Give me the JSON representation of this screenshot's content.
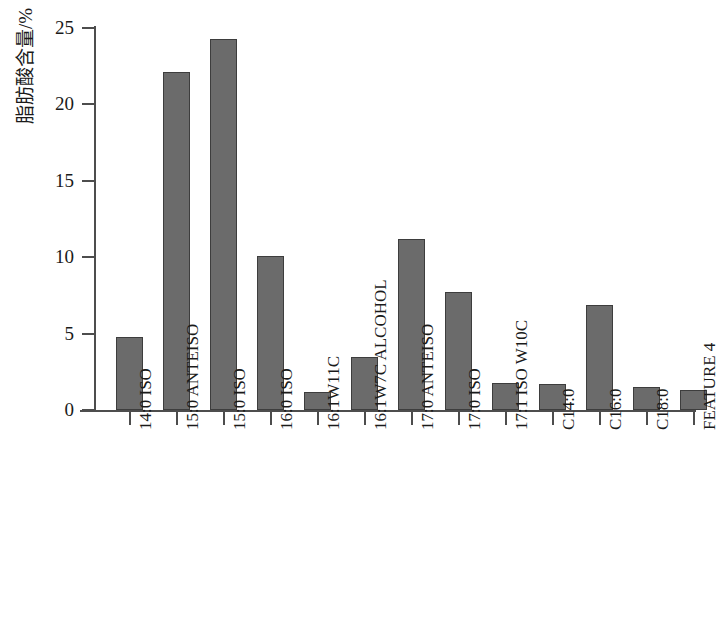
{
  "chart_data": {
    "type": "bar",
    "title": "",
    "xlabel": "",
    "ylabel": "脂肪酸含量/%",
    "ylim": [
      0,
      25
    ],
    "ytick_labels": [
      "0",
      "5",
      "10",
      "15",
      "20",
      "25"
    ],
    "yticks": [
      0,
      5,
      10,
      15,
      20,
      25
    ],
    "grid": false,
    "legend": null,
    "bar_color": "#6b6b6b",
    "bar_edge_color": "#3d3d3d",
    "axis_color": "#4d4d4d",
    "categories": [
      "14:0 ISO",
      "15:0 ANTEISO",
      "15:0 ISO",
      "16:0 ISO",
      "16:1W11C",
      "16:1W7C ALCOHOL",
      "17:0 ANTEISO",
      "17:0 ISO",
      "17:1 ISO W10C",
      "C14:0",
      "C16:0",
      "C18:0",
      "FEATURE 4"
    ],
    "values": [
      4.8,
      22.1,
      24.3,
      10.1,
      1.2,
      3.5,
      11.2,
      7.7,
      1.8,
      1.7,
      6.9,
      1.5,
      1.3
    ]
  }
}
